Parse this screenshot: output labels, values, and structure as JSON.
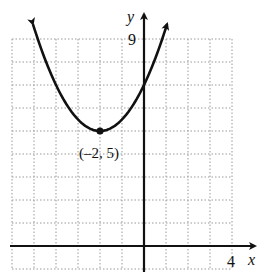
{
  "chart_data": {
    "type": "line",
    "title": "",
    "xlabel": "x",
    "ylabel": "y",
    "xlim": [
      -6,
      4
    ],
    "ylim": [
      -1,
      9
    ],
    "grid": true,
    "grid_style": "dotted",
    "tick_labels": {
      "x": [
        "4"
      ],
      "y": [
        "9"
      ]
    },
    "series": [
      {
        "name": "parabola",
        "equation": "y = 0.5(x + 2)^2 + 5",
        "vertex": [
          -2,
          5
        ],
        "x": [
          -5,
          -4,
          -3,
          -2,
          -1,
          0,
          1
        ],
        "values": [
          9.5,
          7,
          5.5,
          5,
          5.5,
          7,
          9.5
        ],
        "arrows_at_ends": true
      }
    ],
    "annotations": [
      {
        "text": "(–2, 5)",
        "point": [
          -2,
          5
        ],
        "position": "below"
      }
    ]
  },
  "labels": {
    "x_axis": "x",
    "y_axis": "y",
    "x_tick": "4",
    "y_tick": "9",
    "vertex": "(–2, 5)"
  },
  "colors": {
    "curve": "#111111",
    "axes": "#111111",
    "grid": "#9a9a9a",
    "background": "#ffffff"
  }
}
